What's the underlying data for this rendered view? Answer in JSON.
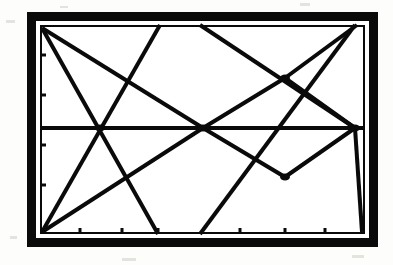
{
  "figure": {
    "title": "",
    "kind": "line-art-geometric-diagram",
    "background_color": "#fdfdfb",
    "ink_color": "#0a0a0a",
    "paper_color": "#ffffff",
    "frame": {
      "name": "outer-frame",
      "x": 27,
      "y": 12,
      "width": 351,
      "height": 235,
      "border_width": 9,
      "gap_color": "#ffffff",
      "gap_width": 4
    },
    "plot_area": {
      "name": "plot-area",
      "x": 40,
      "y": 25,
      "width": 325,
      "height": 209,
      "border_width": 2,
      "left": 40,
      "right": 365,
      "top": 25,
      "bottom": 234
    },
    "axes": {
      "left_axis_label": "",
      "bottom_axis_label": "",
      "tick_length": 6,
      "tick_width": 3,
      "left_ticks": [
        55,
        95,
        145,
        185
      ],
      "bottom_ticks": [
        80,
        122,
        158,
        240,
        285,
        325
      ]
    }
  },
  "chart_data": {
    "type": "line",
    "title": "",
    "xlabel": "",
    "ylabel": "",
    "xlim": [
      40,
      365
    ],
    "ylim": [
      25,
      234
    ],
    "grid": false,
    "legend": null,
    "midline_y": 128,
    "nodes": [
      {
        "name": "node-left-crossing",
        "x": 100,
        "y": 128,
        "marker": true
      },
      {
        "name": "node-center-crossing",
        "x": 203,
        "y": 128,
        "marker": true
      },
      {
        "name": "node-upper-right-crossing",
        "x": 285,
        "y": 78,
        "marker": true
      },
      {
        "name": "node-lower-right-crossing",
        "x": 285,
        "y": 177,
        "marker": true
      },
      {
        "name": "node-right-apex",
        "x": 355,
        "y": 128,
        "marker": true
      }
    ],
    "series": [
      {
        "name": "horizontal-midline",
        "stroke": 4,
        "points": [
          [
            40,
            128
          ],
          [
            365,
            128
          ]
        ]
      },
      {
        "name": "upper-left-shallow-descender",
        "stroke": 4,
        "points": [
          [
            42,
            28
          ],
          [
            158,
            234
          ]
        ]
      },
      {
        "name": "upper-left-steep-descender",
        "stroke": 4,
        "points": [
          [
            42,
            28
          ],
          [
            203,
            128
          ]
        ]
      },
      {
        "name": "lower-left-riser-to-top",
        "stroke": 4,
        "points": [
          [
            42,
            232
          ],
          [
            160,
            25
          ]
        ]
      },
      {
        "name": "lower-left-riser-to-center",
        "stroke": 4,
        "points": [
          [
            42,
            232
          ],
          [
            203,
            128
          ]
        ]
      },
      {
        "name": "center-to-upper-right-zig",
        "stroke": 4,
        "points": [
          [
            203,
            128
          ],
          [
            285,
            78
          ],
          [
            355,
            128
          ]
        ]
      },
      {
        "name": "center-to-lower-right-zag",
        "stroke": 4,
        "points": [
          [
            203,
            128
          ],
          [
            285,
            177
          ],
          [
            355,
            128
          ]
        ]
      },
      {
        "name": "top-descender-to-right-apex",
        "stroke": 4,
        "points": [
          [
            200,
            25
          ],
          [
            355,
            128
          ]
        ]
      },
      {
        "name": "top-riser-from-lower-right",
        "stroke": 4,
        "points": [
          [
            200,
            234
          ],
          [
            355,
            25
          ]
        ]
      },
      {
        "name": "right-apex-to-bottom-right",
        "stroke": 4,
        "points": [
          [
            355,
            128
          ],
          [
            362,
            232
          ]
        ]
      },
      {
        "name": "upper-right-ascender",
        "stroke": 4,
        "points": [
          [
            285,
            78
          ],
          [
            357,
            25
          ]
        ]
      }
    ]
  },
  "specks": [
    {
      "x": 6,
      "y": 20,
      "w": 9,
      "h": 3
    },
    {
      "x": 10,
      "y": 236,
      "w": 7,
      "h": 3
    },
    {
      "x": 122,
      "y": 258,
      "w": 14,
      "h": 3
    },
    {
      "x": 300,
      "y": 3,
      "w": 10,
      "h": 3
    },
    {
      "x": 352,
      "y": 255,
      "w": 12,
      "h": 3
    },
    {
      "x": 60,
      "y": 6,
      "w": 8,
      "h": 2
    }
  ]
}
